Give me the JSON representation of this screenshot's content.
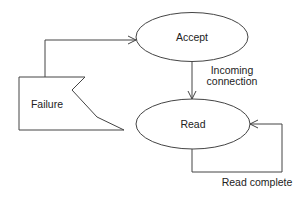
{
  "diagram": {
    "type": "state-diagram",
    "nodes": [
      {
        "id": "accept",
        "label": "Accept",
        "shape": "ellipse"
      },
      {
        "id": "read",
        "label": "Read",
        "shape": "ellipse"
      },
      {
        "id": "failure",
        "label": "Failure",
        "shape": "flag"
      }
    ],
    "edges": [
      {
        "from": "accept",
        "to": "read",
        "label_line1": "Incoming",
        "label_line2": "connection"
      },
      {
        "from": "read",
        "to": "read",
        "label": "Read complete"
      },
      {
        "from": "failure",
        "to": "accept",
        "label": ""
      }
    ]
  },
  "colors": {
    "stroke": "#444444",
    "text": "#222222",
    "background": "#ffffff"
  }
}
